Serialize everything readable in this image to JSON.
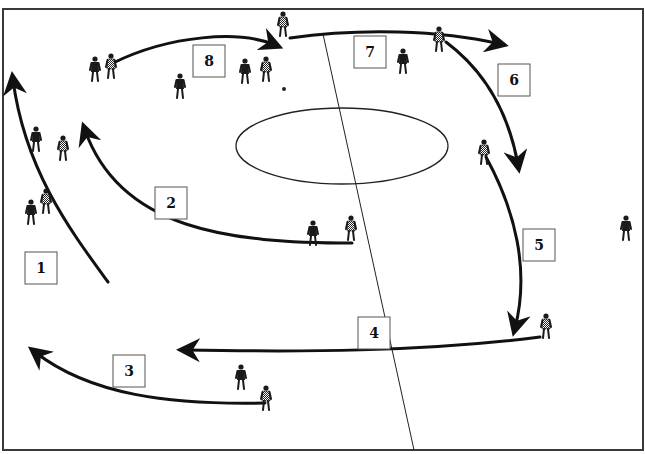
{
  "diagram": {
    "type": "football-tactics-drill",
    "canvas": {
      "width": 645,
      "height": 454
    },
    "pitch": {
      "border": {
        "x": 3,
        "y": 9,
        "width": 640,
        "height": 441
      },
      "centre_line": {
        "x1": 323,
        "y1": 34,
        "x2": 414,
        "y2": 450
      },
      "centre_circle": {
        "cx": 342,
        "cy": 146,
        "rx": 106,
        "ry": 38
      }
    },
    "labels": [
      {
        "id": "1",
        "text": "1",
        "x": 25,
        "y": 252
      },
      {
        "id": "2",
        "text": "2",
        "x": 155,
        "y": 187
      },
      {
        "id": "3",
        "text": "3",
        "x": 113,
        "y": 355
      },
      {
        "id": "4",
        "text": "4",
        "x": 358,
        "y": 317
      },
      {
        "id": "5",
        "text": "5",
        "x": 523,
        "y": 229
      },
      {
        "id": "6",
        "text": "6",
        "x": 498,
        "y": 64
      },
      {
        "id": "7",
        "text": "7",
        "x": 354,
        "y": 36
      },
      {
        "id": "8",
        "text": "8",
        "x": 193,
        "y": 45
      }
    ],
    "arrows": [
      {
        "id": "run-1",
        "path": "M108,282 C70,230 25,170 13,80",
        "head": "13,76"
      },
      {
        "id": "run-2",
        "path": "M352,243 C230,243 120,230 85,130",
        "head": "82,124"
      },
      {
        "id": "run-3",
        "path": "M265,403 C170,405 90,395 35,352",
        "head": "32,350"
      },
      {
        "id": "run-4",
        "path": "M540,337 C420,352 300,352 185,350",
        "head": "182,350"
      },
      {
        "id": "run-5",
        "path": "M486,157 C515,210 530,270 515,328",
        "head": "514,332"
      },
      {
        "id": "run-6",
        "path": "M446,42 C490,75 510,120 518,165",
        "head": "518,168"
      },
      {
        "id": "run-7",
        "path": "M290,38 C360,28 440,30 500,44",
        "head": "503,45"
      },
      {
        "id": "run-8",
        "path": "M113,63 C170,35 240,30 275,45",
        "head": "278,47"
      }
    ],
    "players": [
      {
        "team": "dark",
        "x": 95,
        "y": 70
      },
      {
        "team": "check",
        "x": 111,
        "y": 67
      },
      {
        "team": "dark",
        "x": 180,
        "y": 87
      },
      {
        "team": "dark",
        "x": 245,
        "y": 72
      },
      {
        "team": "check",
        "x": 266,
        "y": 70
      },
      {
        "team": "check",
        "x": 283,
        "y": 25
      },
      {
        "team": "dark",
        "x": 403,
        "y": 62
      },
      {
        "team": "check",
        "x": 439,
        "y": 40
      },
      {
        "team": "dark",
        "x": 36,
        "y": 140
      },
      {
        "team": "check",
        "x": 63,
        "y": 149
      },
      {
        "team": "dark",
        "x": 31,
        "y": 213
      },
      {
        "team": "check",
        "x": 46,
        "y": 202
      },
      {
        "team": "check",
        "x": 484,
        "y": 153
      },
      {
        "team": "dark",
        "x": 313,
        "y": 234
      },
      {
        "team": "check",
        "x": 351,
        "y": 229
      },
      {
        "team": "dark",
        "x": 626,
        "y": 229
      },
      {
        "team": "check",
        "x": 546,
        "y": 327
      },
      {
        "team": "dark",
        "x": 241,
        "y": 378
      },
      {
        "team": "check",
        "x": 266,
        "y": 399
      }
    ],
    "ball": {
      "cx": 284,
      "cy": 89,
      "r": 2
    }
  }
}
